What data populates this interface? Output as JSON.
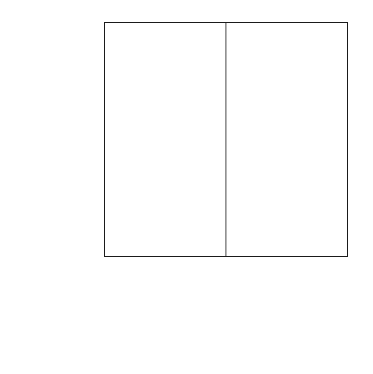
{
  "chart_data": {
    "type": "bar",
    "orientation": "horizontal-diverging",
    "title": "",
    "subtitle": "",
    "xlabel_left": "Percent",
    "xlabel_right": "Percent",
    "ylabel": "",
    "grid": false,
    "legend_position": "bottom-right",
    "xlim_left": [
      80,
      0
    ],
    "xlim_right": [
      0,
      80
    ],
    "xticks_left": [
      "80",
      "60",
      "40",
      "20",
      "0"
    ],
    "xticks_right": [
      "20",
      "40",
      "60",
      "80"
    ],
    "xticks_all": [
      "80",
      "60",
      "40",
      "20",
      "0",
      "20",
      "40",
      "60",
      "80"
    ],
    "categories": [
      "Kwakina",
      "Heshotauthla",
      "Pinnawa",
      "Kechipawan",
      "Unnamed Wt/R",
      "Unnamed R/Bu",
      "Matsaki B/Bu",
      "Matsaki Poly",
      "Hawikuh",
      "Hopi",
      "Salado"
    ],
    "series": [
      {
        "name": "Kechipawan",
        "side": "right",
        "color": "#111111",
        "values": [
          0.0,
          1.7,
          2.3,
          6.7,
          5.0,
          11.7,
          10.8,
          36.7,
          2.6,
          0.6,
          20.8
        ],
        "labels": [
          "0.0",
          "1.7",
          "2.3",
          "6.7",
          "5.0",
          "11.7",
          "10.8",
          "36.7",
          "2.6",
          "0.6",
          "20.8"
        ]
      },
      {
        "name": "Hawikuh",
        "side": "left",
        "color": "#9d9d9d",
        "values": [
          1.8,
          1.8,
          3.6,
          6.9,
          2.7,
          1.5,
          4.2,
          61.6,
          8.1,
          0.6,
          7.2
        ],
        "labels": [
          "1.8",
          "1.8",
          "3.6",
          "6.9",
          "2.7",
          "1.5",
          "4.2",
          "61.6",
          "8.1",
          "0.6",
          "7.2"
        ]
      }
    ]
  },
  "legend": {
    "items": [
      {
        "label": "Kechipawan",
        "color": "#111111"
      },
      {
        "label": "Hawikuh",
        "color": "#9d9d9d"
      }
    ]
  }
}
